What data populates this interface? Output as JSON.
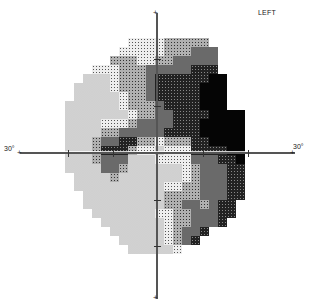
{
  "chart": {
    "eye_label": "LEFT",
    "x_left_label": "30°",
    "x_right_label": "30°",
    "type": "visual-field-greyscale"
  },
  "grid": {
    "origin_x": 38,
    "origin_y": 38,
    "cell": 9,
    "rows": [
      "..........222233333.........",
      ".........22222333444........",
      "........333223344444.........",
      "......22233344444555........",
      ".....1112333455555566.......",
      "....11112333455555666.......",
      "....11111233455555666.......",
      "...111111233345555666.......",
      "...11111112334455556666.....",
      "...11112223444455566666.....",
      "...11113344444555566666.....",
      "...11134455332333556666.....",
      "...11135553221222555566.....",
      "...11134441112222444556.....",
      "...11114431111112344455.....",
      "....1111311111112344455.....",
      "....1111111111223344455.....",
      ".....111111111333344455.....",
      ".....11111111133443455......",
      "......1111111223344455......",
      ".......11111112334445.......",
      "........11111123445.........",
      ".........111112345..........",
      "..........111112............",
      "............................",
      "............................"
    ]
  },
  "tone_levels": {
    "1": "#f4f4f4",
    "2": "#dcdcdc",
    "3": "#a8a8a8",
    "4": "#6a6a6a",
    "5": "#2a2a2a",
    "6": "#050505"
  }
}
